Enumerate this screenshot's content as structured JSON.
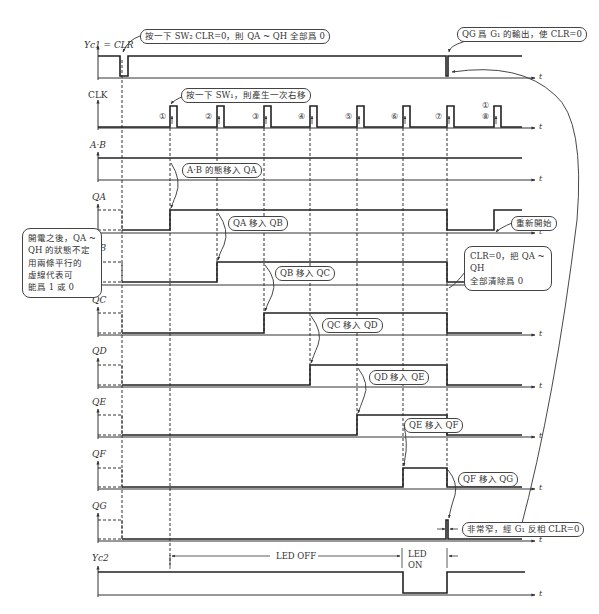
{
  "signals": [
    {
      "id": "clr",
      "label": "Y_c1 = CLR̅"
    },
    {
      "id": "clk",
      "label": "CLK"
    },
    {
      "id": "ab",
      "label": "A·B"
    },
    {
      "id": "qa",
      "label": "Q_A"
    },
    {
      "id": "qb",
      "label": "Q_B"
    },
    {
      "id": "qc",
      "label": "Q_C"
    },
    {
      "id": "qd",
      "label": "Q_D"
    },
    {
      "id": "qe",
      "label": "Q_E"
    },
    {
      "id": "qf",
      "label": "Q_F"
    },
    {
      "id": "qg",
      "label": "Q_G"
    },
    {
      "id": "yc2",
      "label": "Y_c2"
    }
  ],
  "labels": {
    "clr": "Yc1 = CLR",
    "clk": "CLK",
    "ab": "A·B",
    "qa": "QA",
    "qb": "QB",
    "qc": "QC",
    "qd": "QD",
    "qe": "QE",
    "qf": "QF",
    "qg": "QG",
    "yc2": "Yc2",
    "time_axis": "t"
  },
  "clock_numbers": [
    "①",
    "②",
    "③",
    "④",
    "⑤",
    "⑥",
    "⑦",
    "⑧"
  ],
  "clock_restart_number": "①",
  "notes": {
    "clr_press": "按一下 SW₂ CLR=0，則 QA ~ QH 全部爲 0",
    "qg_output": "QG 爲 G₁ 的輸出，使 CLR=0",
    "clk_press": "按一下 SW₁，則產生一次右移",
    "ab_shift": "A·B 的態移入 QA",
    "qa_shift": "QA 移入 QB",
    "qb_shift": "QB 移入 QC",
    "qc_shift": "QC 移入 QD",
    "qd_shift": "QD 移入 QE",
    "qe_shift": "QE 移入 QF",
    "qf_shift": "QF 移入 QG",
    "restart": "重新開始",
    "clear_all_line1": "CLR=0，把 QA ~ QH",
    "clear_all_line2": "全部清除爲 0",
    "power_on_line1": "開電之後，QA ~",
    "power_on_line2": "QH 的狀態不定",
    "power_on_line3": "用兩條平行的",
    "power_on_line4": "虛線代表可",
    "power_on_line5": "能爲 1 或 0",
    "narrow_pulse": "非常窄，經 G₁ 反相 CLR=0",
    "led_off": "LED OFF",
    "led_on_line1": "LED",
    "led_on_line2": "ON"
  }
}
